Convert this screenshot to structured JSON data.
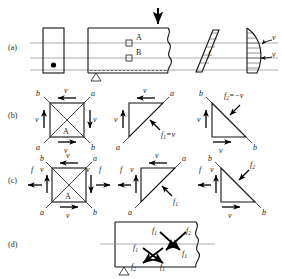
{
  "figure": {
    "row_labels": [
      "(a)",
      "(b)",
      "(c)",
      "(d)"
    ]
  },
  "panel_a": {
    "label": "(a)",
    "cross_section_name": "beam-cross-section",
    "element_labels": [
      "A",
      "B"
    ],
    "load_arrow": "downward-point-load",
    "support": "triangle-roller-support",
    "moment_diagram_label": "f",
    "shear_diagram_labels": [
      "v",
      "v"
    ],
    "neutral_axis": "centroidal-axis"
  },
  "panel_b": {
    "label": "(b)",
    "square": {
      "center_label": "A",
      "corner_top_left": "b",
      "corner_top_right": "a",
      "corner_bottom_left": "a",
      "corner_bottom_right": "b",
      "arrow_top": "v",
      "arrow_right": "v",
      "arrow_bottom": "v",
      "arrow_left": "v"
    },
    "triangle_1": {
      "corner_top_right": "a",
      "corner_bottom_left": "a",
      "arrow_top": "v",
      "arrow_left": "v",
      "diagonal_force": "f",
      "diagonal_force_sub": "1",
      "diagonal_force_value": "=v"
    },
    "triangle_2": {
      "corner_top_left": "b",
      "corner_bottom_right": "b",
      "arrow_left": "v",
      "arrow_bottom": "v",
      "diagonal_force": "f",
      "diagonal_force_sub": "2",
      "diagonal_force_value": "=−v"
    }
  },
  "panel_c": {
    "label": "(c)",
    "square": {
      "center_label": "A",
      "corner_top_left": "b",
      "corner_top_right": "a",
      "corner_bottom_left": "a",
      "corner_bottom_right": "b",
      "arrow_top": "v",
      "arrow_bottom": "v",
      "arrow_left_inner": "v",
      "arrow_right_inner": "v",
      "arrow_left_outer": "f",
      "arrow_right_outer": "f"
    },
    "triangle_1": {
      "corner_top_right": "a",
      "corner_bottom_left": "a",
      "arrow_top": "v",
      "arrow_left_inner": "v",
      "arrow_left_outer": "f",
      "diagonal_force": "f",
      "diagonal_force_sub": "1"
    },
    "triangle_2": {
      "corner_top_left": "b",
      "corner_bottom_right": "b",
      "arrow_left_inner": "v",
      "arrow_left_outer": "f",
      "arrow_bottom": "v",
      "diagonal_force": "f",
      "diagonal_force_sub": "2"
    }
  },
  "panel_d": {
    "label": "(d)",
    "support": "triangle-roller-support",
    "cross_upper": {
      "top_left": "f",
      "top_left_sub": "1",
      "top_right": "f",
      "top_right_sub": "2",
      "bottom_right": "f",
      "bottom_right_sub": "1"
    },
    "cross_lower": {
      "top_left": "f",
      "top_left_sub": "1",
      "bottom_left": "f",
      "bottom_left_sub": "2",
      "bottom_right": "f",
      "bottom_right_sub": "1"
    }
  },
  "colors": {
    "ink": "#1a1a1a",
    "axis": "#8a8a8a",
    "background": "#ffffff"
  }
}
